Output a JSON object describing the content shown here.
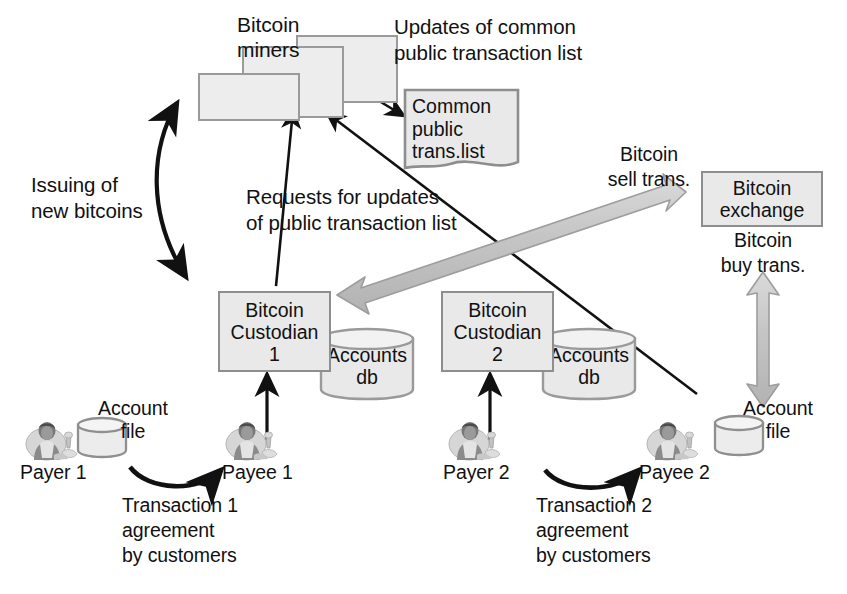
{
  "figure": {
    "type": "diagram",
    "colors": {
      "box_fill": "#e9e9e9",
      "box_stroke": "#8e8e8e",
      "thin_arrow": "#111111",
      "thick_arrow_fill": "#c9c9c9",
      "thick_arrow_stroke": "#9a9a9a",
      "text": "#111111",
      "background": "#ffffff"
    }
  },
  "nodes": {
    "miners": {
      "label": "Bitcoin\nminers",
      "stack_count": 3
    },
    "common_list": {
      "label": "Common\npublic\ntrans.list",
      "shape": "document"
    },
    "custodian1": {
      "label": "Bitcoin\nCustodian\n1",
      "shape": "rectangle"
    },
    "custodian2": {
      "label": "Bitcoin\nCustodian\n2",
      "shape": "rectangle"
    },
    "accounts_db1": {
      "label": "Accounts\ndb",
      "shape": "cylinder"
    },
    "accounts_db2": {
      "label": "Accounts\ndb",
      "shape": "cylinder"
    },
    "exchange": {
      "label": "Bitcoin\nexchange",
      "shape": "rectangle"
    },
    "account_file1": {
      "label": "Account\nfile",
      "shape": "cylinder"
    },
    "account_file2": {
      "label": "Account\nfile",
      "shape": "cylinder"
    },
    "payer1": {
      "label": "Payer 1",
      "icon": "person-icon"
    },
    "payee1": {
      "label": "Payee 1",
      "icon": "person-icon"
    },
    "payer2": {
      "label": "Payer 2",
      "icon": "person-icon"
    },
    "payee2": {
      "label": "Payee 2",
      "icon": "person-icon"
    }
  },
  "edge_labels": {
    "updates_of_common": "Updates of common\npublic transaction list",
    "issuing": "Issuing of\nnew bitcoins",
    "requests": "Requests for updates\nof public transaction list",
    "sell_trans": "Bitcoin\nsell trans.",
    "buy_trans": "Bitcoin\nbuy trans.",
    "transaction1": "Transaction 1\nagreement\nby customers",
    "transaction2": "Transaction 2\nagreement\nby customers"
  },
  "edges": [
    {
      "name": "miners-to-common-list",
      "from": "miners",
      "to": "common_list",
      "style": "thin-arrow",
      "label": "updates_of_common"
    },
    {
      "name": "issuing-new-bitcoins",
      "from": "custodian1",
      "to": "miners",
      "style": "thin-curved-double-arrow",
      "label": "issuing"
    },
    {
      "name": "custodian1-to-miners",
      "from": "custodian1",
      "to": "miners",
      "style": "thin-arrow",
      "label": "requests"
    },
    {
      "name": "payee2-to-common-list",
      "from": "payee2",
      "to": "common_list",
      "style": "thin-arrow",
      "label": "requests"
    },
    {
      "name": "custodian1-to-exchange",
      "from": "custodian1",
      "to": "exchange",
      "style": "thick-gray-double-arrow",
      "label": "sell_trans"
    },
    {
      "name": "account-file2-to-exchange",
      "from": "account_file2",
      "to": "exchange",
      "style": "thick-gray-double-arrow",
      "label": "buy_trans"
    },
    {
      "name": "payer1-to-payee1",
      "from": "payer1",
      "to": "payee1",
      "style": "thin-curved-arrow",
      "label": "transaction1"
    },
    {
      "name": "payer2-to-payee2",
      "from": "payer2",
      "to": "payee2",
      "style": "thin-curved-arrow",
      "label": "transaction2"
    },
    {
      "name": "payee1-to-custodian1",
      "from": "payee1",
      "to": "custodian1",
      "style": "thin-arrow"
    },
    {
      "name": "payer2-to-custodian2",
      "from": "payer2",
      "to": "custodian2",
      "style": "thin-arrow"
    }
  ]
}
